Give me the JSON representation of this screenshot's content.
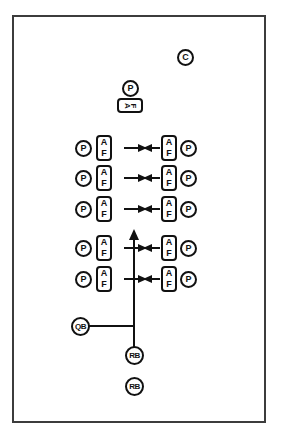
{
  "diagram": {
    "border_color": "#3c3c3c",
    "ink_color": "#111111",
    "background": "#ffffff",
    "center_unit": {
      "back_label": "P",
      "line_labels": [
        "A",
        "F"
      ]
    },
    "coach_marker": {
      "label": "C"
    },
    "rows": [
      {
        "left_back": "P",
        "left_line": [
          "A",
          "F"
        ],
        "right_line": [
          "A",
          "F"
        ],
        "right_back": "P"
      },
      {
        "left_back": "P",
        "left_line": [
          "A",
          "F"
        ],
        "right_line": [
          "A",
          "F"
        ],
        "right_back": "P"
      },
      {
        "left_back": "P",
        "left_line": [
          "A",
          "F"
        ],
        "right_line": [
          "A",
          "F"
        ],
        "right_back": "P"
      },
      {
        "left_back": "P",
        "left_line": [
          "A",
          "F"
        ],
        "right_line": [
          "A",
          "F"
        ],
        "right_back": "P"
      },
      {
        "left_back": "P",
        "left_line": [
          "A",
          "F"
        ],
        "right_line": [
          "A",
          "F"
        ],
        "right_back": "P"
      }
    ],
    "backfield": {
      "quarterback": "QB",
      "runningback_1": "RB",
      "runningback_2": "RB"
    }
  }
}
